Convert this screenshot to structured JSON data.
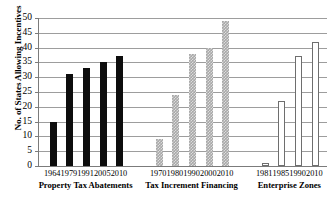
{
  "chart_data": {
    "type": "bar",
    "title": "",
    "xlabel": "",
    "ylabel": "No. of States Allowing Incentives",
    "ylim": [
      0,
      50
    ],
    "ytick_labels": [
      "0",
      "5",
      "10",
      "15",
      "20",
      "25",
      "30",
      "35",
      "40",
      "45",
      "50"
    ],
    "ytick_values": [
      0,
      5,
      10,
      15,
      20,
      25,
      30,
      35,
      40,
      45,
      50
    ],
    "grid": true,
    "legend": "none",
    "groups": [
      {
        "name": "Property Tax Abatements",
        "fill": "solid-black",
        "categories": [
          "1964",
          "1979",
          "1991",
          "2005",
          "2010"
        ],
        "values": [
          15,
          31,
          33,
          35,
          37
        ]
      },
      {
        "name": "Tax Increment Financing",
        "fill": "gray-hatched",
        "categories": [
          "1970",
          "1980",
          "1990",
          "2000",
          "2010"
        ],
        "values": [
          9,
          24,
          38,
          40,
          49
        ]
      },
      {
        "name": "Enterprise Zones",
        "fill": "white-outlined",
        "categories": [
          "1981",
          "1985",
          "1990",
          "2010"
        ],
        "values": [
          1,
          22,
          37,
          42
        ]
      }
    ]
  },
  "colors": {
    "solid_bar": "#0d0d0d",
    "hatched_bar": "#a8a8a8",
    "open_bar_border": "#6e6e6e",
    "gridline": "#9d9d9d",
    "axis": "#7b7b7b",
    "text": "#000000"
  }
}
